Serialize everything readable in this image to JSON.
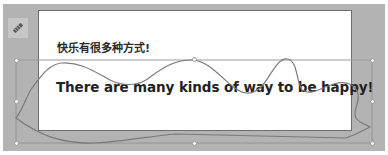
{
  "slide": {
    "subtitle": "快乐有很多种方式!",
    "headline": "There are many kinds of way to be happy!"
  },
  "tool_icon": {
    "name": "pencil-icon"
  },
  "selection": {
    "shape": "freeform-curve",
    "handles": [
      "top-left",
      "top-middle",
      "top-right",
      "middle-left",
      "middle-right",
      "bottom-left",
      "bottom-middle",
      "bottom-right"
    ]
  },
  "colors": {
    "workspace_bg": "#b3b3b3",
    "slide_bg": "#ffffff",
    "curve_stroke": "#7a7a7a",
    "text": "#222222"
  }
}
